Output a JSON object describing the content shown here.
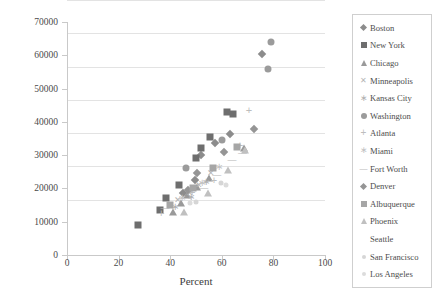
{
  "chart_data": {
    "type": "scatter",
    "title": "",
    "xlabel": "Percent",
    "ylabel": "Dollars ($)",
    "xlim": [
      0,
      100
    ],
    "ylim": [
      0,
      70000
    ],
    "xticks": [
      0,
      20,
      40,
      60,
      80,
      100
    ],
    "yticks": [
      0,
      10000,
      20000,
      30000,
      40000,
      50000,
      60000,
      70000
    ],
    "grid": true,
    "legend_position": "right",
    "series": [
      {
        "name": "Boston",
        "marker": "diamond",
        "color": "#8c8c8c",
        "points": [
          {
            "x": 75.5,
            "y": 60500
          },
          {
            "x": 63.0,
            "y": 36500
          },
          {
            "x": 57.5,
            "y": 33500
          },
          {
            "x": 52.0,
            "y": 30000
          },
          {
            "x": 49.5,
            "y": 22500
          },
          {
            "x": 45.0,
            "y": 18500
          }
        ]
      },
      {
        "name": "New York",
        "marker": "square",
        "color": "#6e6e6e",
        "points": [
          {
            "x": 62.0,
            "y": 43000
          },
          {
            "x": 64.5,
            "y": 42500
          },
          {
            "x": 55.5,
            "y": 35500
          },
          {
            "x": 52.0,
            "y": 32000
          },
          {
            "x": 50.0,
            "y": 29000
          },
          {
            "x": 43.5,
            "y": 21000
          },
          {
            "x": 38.5,
            "y": 17000
          },
          {
            "x": 36.0,
            "y": 13500
          },
          {
            "x": 27.5,
            "y": 9000
          }
        ]
      },
      {
        "name": "Chicago",
        "marker": "triangle",
        "color": "#9a9a9a",
        "points": [
          {
            "x": 68.5,
            "y": 32000
          },
          {
            "x": 55.0,
            "y": 23000
          },
          {
            "x": 50.5,
            "y": 20500
          },
          {
            "x": 46.5,
            "y": 18000
          },
          {
            "x": 44.0,
            "y": 15500
          },
          {
            "x": 41.0,
            "y": 13000
          }
        ]
      },
      {
        "name": "Minneapolis",
        "marker": "x",
        "color": "#b5b5b5",
        "points": [
          {
            "x": 56.0,
            "y": 24500
          },
          {
            "x": 51.0,
            "y": 21000
          },
          {
            "x": 47.5,
            "y": 18500
          },
          {
            "x": 43.0,
            "y": 16500
          }
        ]
      },
      {
        "name": "Kansas City",
        "marker": "star",
        "color": "#b0b0b0",
        "points": [
          {
            "x": 54.0,
            "y": 22000
          },
          {
            "x": 48.0,
            "y": 17500
          },
          {
            "x": 42.0,
            "y": 14500
          }
        ]
      },
      {
        "name": "Washington",
        "marker": "circle",
        "color": "#9b9b9b",
        "points": [
          {
            "x": 79.0,
            "y": 64000
          },
          {
            "x": 78.0,
            "y": 56000
          },
          {
            "x": 60.0,
            "y": 34500
          },
          {
            "x": 46.0,
            "y": 26000
          }
        ]
      },
      {
        "name": "Atlanta",
        "marker": "plus",
        "color": "#bdbdbd",
        "points": [
          {
            "x": 70.5,
            "y": 43500
          },
          {
            "x": 67.0,
            "y": 33000
          },
          {
            "x": 57.0,
            "y": 22500
          },
          {
            "x": 48.5,
            "y": 19000
          },
          {
            "x": 36.5,
            "y": 12500
          }
        ]
      },
      {
        "name": "Miami",
        "marker": "star",
        "color": "#c2c2c2",
        "points": [
          {
            "x": 59.0,
            "y": 26500
          },
          {
            "x": 52.5,
            "y": 21500
          },
          {
            "x": 44.5,
            "y": 17000
          }
        ]
      },
      {
        "name": "Fort Worth",
        "marker": "dash",
        "color": "#b8b8b8",
        "points": [
          {
            "x": 68.0,
            "y": 30500
          },
          {
            "x": 64.0,
            "y": 28500
          },
          {
            "x": 58.0,
            "y": 24000
          },
          {
            "x": 53.0,
            "y": 20000
          },
          {
            "x": 38.0,
            "y": 14000
          }
        ]
      },
      {
        "name": "Denver",
        "marker": "diamond",
        "color": "#959595",
        "points": [
          {
            "x": 72.5,
            "y": 38000
          },
          {
            "x": 61.0,
            "y": 31000
          },
          {
            "x": 50.5,
            "y": 24500
          },
          {
            "x": 47.0,
            "y": 19500
          }
        ]
      },
      {
        "name": "Albuquerque",
        "marker": "square",
        "color": "#a6a6a6",
        "points": [
          {
            "x": 66.0,
            "y": 32500
          },
          {
            "x": 56.5,
            "y": 26000
          },
          {
            "x": 49.0,
            "y": 20000
          },
          {
            "x": 40.0,
            "y": 15000
          }
        ]
      },
      {
        "name": "Phoenix",
        "marker": "triangle",
        "color": "#c0c0c0",
        "points": [
          {
            "x": 69.0,
            "y": 31500
          },
          {
            "x": 62.5,
            "y": 25500
          },
          {
            "x": 54.5,
            "y": 18500
          },
          {
            "x": 45.5,
            "y": 13000
          }
        ]
      },
      {
        "name": "Seattle",
        "marker": "none",
        "color": "#d2d2d2",
        "points": []
      },
      {
        "name": "San Francisco",
        "marker": "dot",
        "color": "#d6d6d6",
        "points": [
          {
            "x": 59.5,
            "y": 21500
          },
          {
            "x": 50.0,
            "y": 16000
          }
        ]
      },
      {
        "name": "Los Angeles",
        "marker": "dot",
        "color": "#dcdcdc",
        "points": [
          {
            "x": 61.5,
            "y": 21000
          },
          {
            "x": 47.5,
            "y": 15500
          }
        ]
      }
    ]
  }
}
